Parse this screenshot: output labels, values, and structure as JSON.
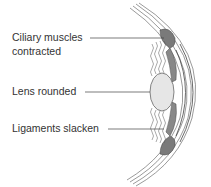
{
  "diagram": {
    "type": "eye-accommodation-near-focus",
    "labels": [
      {
        "id": "ciliary",
        "line1": "Ciliary muscles",
        "line2": "contracted"
      },
      {
        "id": "lens",
        "line1": "Lens rounded"
      },
      {
        "id": "ligaments",
        "line1": "Ligaments slacken"
      }
    ],
    "colors": {
      "text": "#333333",
      "line": "#444444",
      "lens_fill": "#e6e6e6",
      "muscle_fill": "#7a7a7a",
      "stroke": "#555555"
    }
  }
}
